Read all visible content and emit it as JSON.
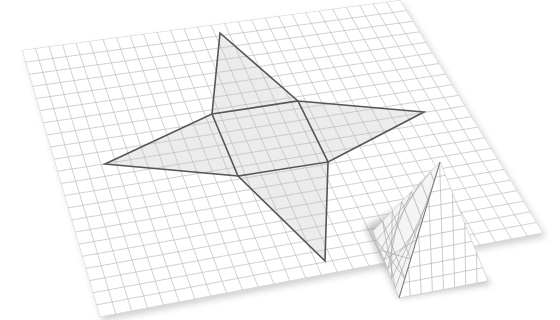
{
  "figure": {
    "title": "Net of a square pyramid on grid paper",
    "colors": {
      "background": "#ffffff",
      "paper": "#ffffff",
      "grid_line": "#bdbdbd",
      "net_fill": "#ececec",
      "net_outline": "#555555",
      "shadow": "#9a9a9a"
    },
    "sheet": {
      "corners": {
        "top_left": [
          22,
          50
        ],
        "top_right": [
          400,
          0
        ],
        "bottom_right": [
          543,
          233
        ],
        "bottom_left": [
          100,
          317
        ]
      },
      "grid_divisions_u": 28,
      "grid_divisions_v": 22
    },
    "net": {
      "square": {
        "tl": [
          212,
          114
        ],
        "tr": [
          298,
          101
        ],
        "br": [
          328,
          162
        ],
        "bl": [
          238,
          176
        ]
      },
      "tips": {
        "top": [
          220,
          33
        ],
        "right": [
          424,
          112
        ],
        "bottom": [
          325,
          261
        ],
        "left": [
          105,
          164
        ]
      }
    },
    "pyramid": {
      "apex": [
        440,
        162
      ],
      "base_left": [
        373,
        231
      ],
      "base_front": [
        399,
        298
      ],
      "base_right": [
        488,
        281
      ]
    }
  }
}
